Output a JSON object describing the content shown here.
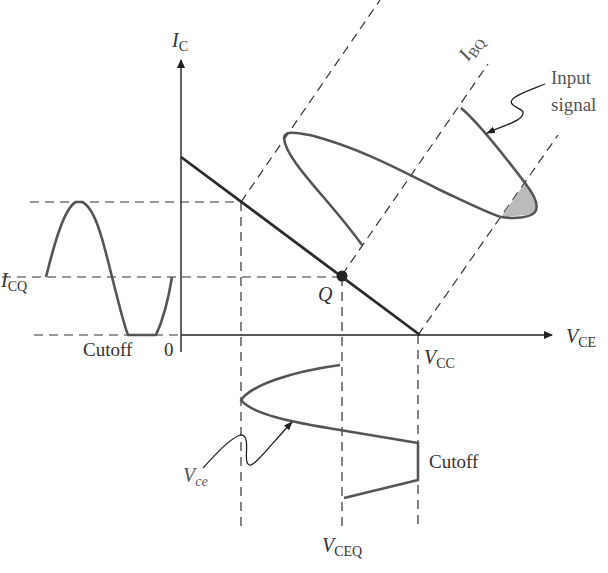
{
  "figure": {
    "labels": {
      "y_axis": {
        "main": "I",
        "sub": "C"
      },
      "x_axis": {
        "main": "V",
        "sub": "CE"
      },
      "icq": {
        "main": "I",
        "sub": "CQ"
      },
      "ibq": {
        "main": "I",
        "sub": "BQ"
      },
      "vcc": {
        "main": "V",
        "sub": "CC"
      },
      "vceq": {
        "main": "V",
        "sub": "CEQ"
      },
      "vce_signal": {
        "main": "V",
        "sub": "ce"
      },
      "q_point": "Q",
      "origin": "0",
      "cutoff_left": "Cutoff",
      "cutoff_bottom": "Cutoff",
      "input_signal_line1": "Input",
      "input_signal_line2": "signal"
    },
    "colors": {
      "axis": "#222222",
      "load_line": "#2a2a2a",
      "waveform": "#555555",
      "dashed": "#333333",
      "shaded_region": "#bbbbbb",
      "text": "#333333"
    }
  }
}
